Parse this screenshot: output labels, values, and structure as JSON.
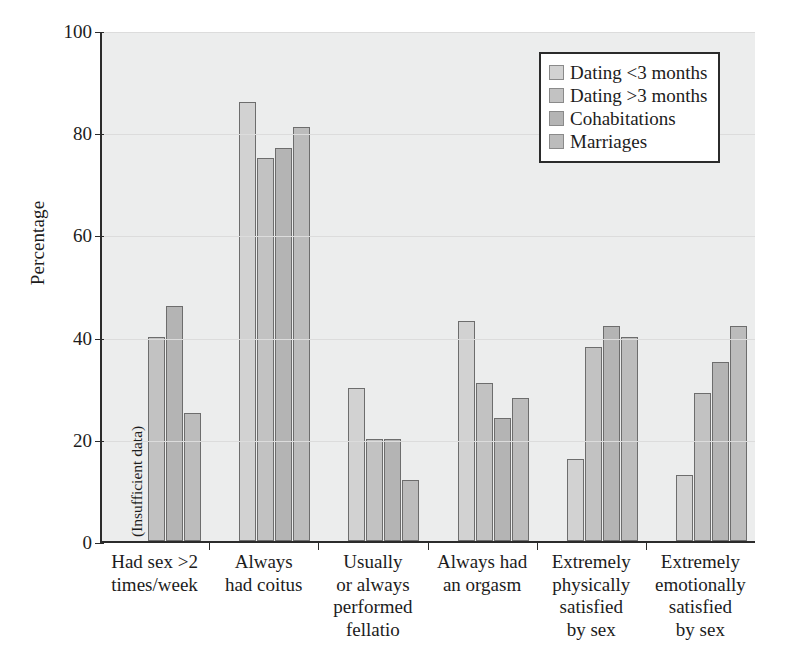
{
  "chart_data": {
    "type": "bar",
    "title": "",
    "subtitle": "",
    "xlabel": "",
    "ylabel": "Percentage",
    "ylim": [
      0,
      100
    ],
    "yticks": [
      0,
      20,
      40,
      60,
      80,
      100
    ],
    "ytick_labels": [
      "0",
      "20",
      "40",
      "60",
      "80",
      "100"
    ],
    "grid": "horizontal",
    "legend_position": "top-right",
    "categories": [
      "Had sex >2\ntimes/week",
      "Always\nhad coitus",
      "Usually\nor always\nperformed\nfellatio",
      "Always had\nan orgasm",
      "Extremely\nphysically\nsatisfied\nby sex",
      "Extremely\nemotionally\nsatisfied\nby sex"
    ],
    "category_lines": [
      [
        "Had sex >2",
        "times/week"
      ],
      [
        "Always",
        "had coitus"
      ],
      [
        "Usually",
        "or always",
        "performed",
        "fellatio"
      ],
      [
        "Always had",
        "an orgasm"
      ],
      [
        "Extremely",
        "physically",
        "satisfied",
        "by sex"
      ],
      [
        "Extremely",
        "emotionally",
        "satisfied",
        "by sex"
      ]
    ],
    "series": [
      {
        "name": "Dating <3 months",
        "color": "#d2d2d2",
        "values": [
          null,
          86,
          30,
          43,
          16,
          13
        ],
        "annotations": [
          "(Insufficient data)",
          "",
          "",
          "",
          "",
          ""
        ]
      },
      {
        "name": "Dating >3 months",
        "color": "#c2c2c2",
        "values": [
          40,
          75,
          20,
          31,
          38,
          29
        ]
      },
      {
        "name": "Cohabitations",
        "color": "#b4b4b4",
        "values": [
          46,
          77,
          20,
          24,
          42,
          35
        ]
      },
      {
        "name": "Marriages",
        "color": "#bcbcbc",
        "values": [
          25,
          81,
          12,
          28,
          40,
          42
        ]
      }
    ],
    "notes": [
      "(Insufficient data)"
    ]
  },
  "legend": {
    "items": [
      {
        "label": "Dating <3 months",
        "swatch": "s0"
      },
      {
        "label": "Dating >3 months",
        "swatch": "s1"
      },
      {
        "label": "Cohabitations",
        "swatch": "s2"
      },
      {
        "label": "Marriages",
        "swatch": "s3"
      }
    ]
  },
  "axis": {
    "y_title": "Percentage",
    "y_ticks": [
      "100",
      "80",
      "60",
      "40",
      "20",
      "0"
    ]
  },
  "colors": {
    "plot_background": "#eceded",
    "axis": "#2b2b2b",
    "gridline": "#dcdcdc",
    "bar_outline": "#6d6d6d",
    "text": "#1c1c1c"
  }
}
